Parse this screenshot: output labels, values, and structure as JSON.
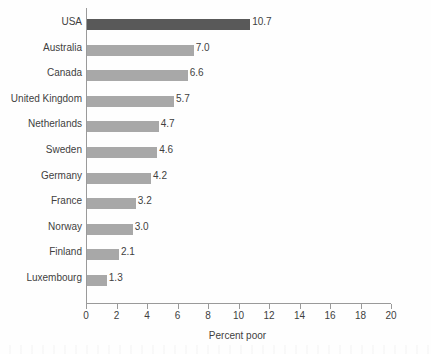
{
  "chart_data": {
    "type": "bar",
    "orientation": "horizontal",
    "title": "",
    "xlabel": "Percent poor",
    "ylabel": "",
    "xlim": [
      0,
      20
    ],
    "xticks": [
      0,
      2,
      4,
      6,
      8,
      10,
      12,
      14,
      16,
      18,
      20
    ],
    "xtick_labels": [
      "0",
      "2",
      "4",
      "6",
      "8",
      "10",
      "12",
      "14",
      "16",
      "18",
      "20"
    ],
    "grid": false,
    "legend": false,
    "categories": [
      "USA",
      "Australia",
      "Canada",
      "United Kingdom",
      "Netherlands",
      "Sweden",
      "Germany",
      "France",
      "Norway",
      "Finland",
      "Luxembourg"
    ],
    "values": [
      10.7,
      7.0,
      6.6,
      5.7,
      4.7,
      4.6,
      4.2,
      3.2,
      3.0,
      2.1,
      1.3
    ],
    "value_labels": [
      "10.7",
      "7.0",
      "6.6",
      "5.7",
      "4.7",
      "4.6",
      "4.2",
      "3.2",
      "3.0",
      "2.1",
      "1.3"
    ],
    "bar_colors": [
      "#595959",
      "#a8a8a8",
      "#a8a8a8",
      "#a8a8a8",
      "#a8a8a8",
      "#a8a8a8",
      "#a8a8a8",
      "#a8a8a8",
      "#a8a8a8",
      "#a8a8a8",
      "#a8a8a8"
    ],
    "highlight_category": "USA",
    "colors": {
      "highlight_bar": "#595959",
      "default_bar": "#a8a8a8",
      "axis": "#9a9a9a",
      "text": "#3f3f3f",
      "background": "#fefefe"
    }
  },
  "axis": {
    "x_title": "Percent poor"
  }
}
